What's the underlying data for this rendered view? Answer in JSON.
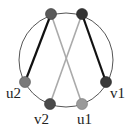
{
  "diagram": {
    "type": "graph-on-circle",
    "circle": {
      "cx": 66,
      "cy": 60,
      "r": 47,
      "stroke": "#555555"
    },
    "nodes": [
      {
        "id": "t1",
        "label": "",
        "x": 51,
        "y": 14,
        "color": "#5a5a5a"
      },
      {
        "id": "t2",
        "label": "",
        "x": 82,
        "y": 14,
        "color": "#333333"
      },
      {
        "id": "u2",
        "label": "u2",
        "x": 25,
        "y": 82,
        "color": "#7a7a7a",
        "label_x": 7,
        "label_y": 97
      },
      {
        "id": "v2",
        "label": "v2",
        "x": 50,
        "y": 104,
        "color": "#4a4a4a",
        "label_x": 35,
        "label_y": 124
      },
      {
        "id": "u1",
        "label": "u1",
        "x": 82,
        "y": 104,
        "color": "#9a9a9a",
        "label_x": 77,
        "label_y": 124
      },
      {
        "id": "v1",
        "label": "v1",
        "x": 106,
        "y": 82,
        "color": "#3a3a3a",
        "label_x": 110,
        "label_y": 97
      }
    ],
    "edges": [
      {
        "from": "t1",
        "to": "u2",
        "color": "#111111",
        "width": 2.2
      },
      {
        "from": "t1",
        "to": "u1",
        "color": "#aaaaaa",
        "width": 1.6
      },
      {
        "from": "t2",
        "to": "v1",
        "color": "#111111",
        "width": 2.2
      },
      {
        "from": "t2",
        "to": "v2",
        "color": "#aaaaaa",
        "width": 1.6
      }
    ],
    "labels": {
      "u2": "u2",
      "v2": "v2",
      "u1": "u1",
      "v1": "v1"
    }
  }
}
